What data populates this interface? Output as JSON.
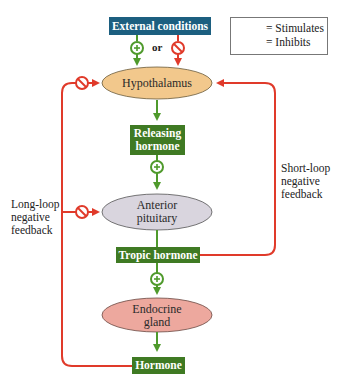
{
  "diagram": {
    "colors": {
      "stimulate": "#4f9a2c",
      "inhibit": "#e03a2a",
      "external_box": "#1c5f80",
      "hormone_box": "#3f7a23",
      "hypothalamus_fill": "#f2c88c",
      "pituitary_fill": "#d9d5de",
      "gland_fill": "#eda89e"
    },
    "nodes": {
      "external": "External conditions",
      "or_label": "or",
      "hypothalamus": "Hypothalamus",
      "releasing_line1": "Releasing",
      "releasing_line2": "hormone",
      "pituitary_line1": "Anterior",
      "pituitary_line2": "pituitary",
      "tropic": "Tropic hormone",
      "gland_line1": "Endocrine",
      "gland_line2": "gland",
      "hormone": "Hormone"
    },
    "loops": {
      "long_line1": "Long-loop",
      "long_line2": "negative",
      "long_line3": "feedback",
      "short_line1": "Short-loop",
      "short_line2": "negative",
      "short_line3": "feedback"
    },
    "legend": {
      "stimulates": "= Stimulates",
      "inhibits": "= Inhibits",
      "stimulate_icon": "plus-circle-arrow",
      "inhibit_icon": "no-circle-arrow"
    }
  }
}
